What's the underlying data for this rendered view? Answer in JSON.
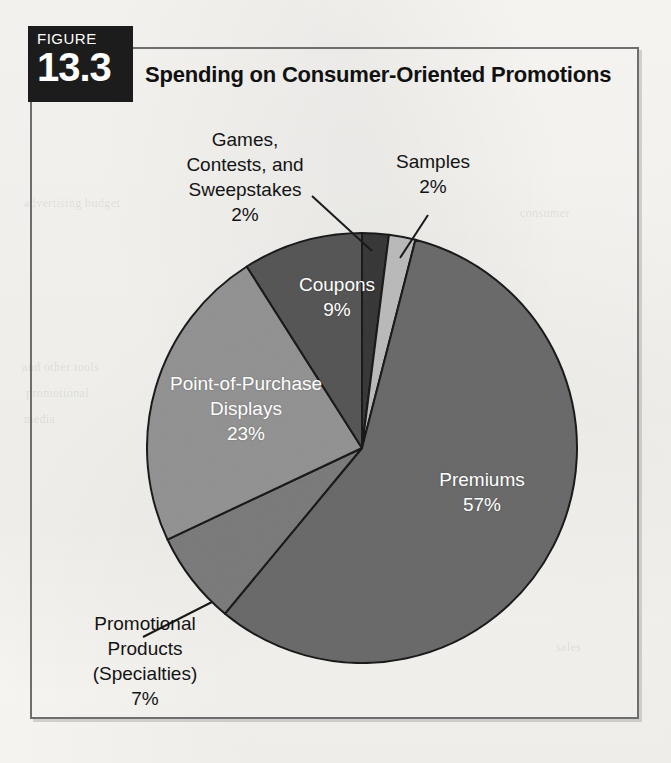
{
  "figure": {
    "badge_word": "FIGURE",
    "badge_number": "13.3",
    "title": "Spending on Consumer-Oriented Promotions"
  },
  "chart_data": {
    "type": "pie",
    "title": "Spending on Consumer-Oriented Promotions",
    "xlabel": "",
    "ylabel": "",
    "legend_position": "none",
    "grid": false,
    "total": 100,
    "units": "percent",
    "start_angle_deg": 0,
    "direction": "clockwise",
    "categories": [
      "Games, Contests, and Sweepstakes",
      "Samples",
      "Premiums",
      "Promotional Products (Specialties)",
      "Point-of-Purchase Displays",
      "Coupons"
    ],
    "values": [
      2,
      2,
      57,
      7,
      23,
      9
    ],
    "slices": [
      {
        "name": "Games, Contests, and Sweepstakes",
        "label_lines": [
          "Games,",
          "Contests, and",
          "Sweepstakes"
        ],
        "value": 2,
        "value_label": "2%",
        "color": "#3a3a3a",
        "label_placement": "callout",
        "start_deg": 0,
        "end_deg": 7.2
      },
      {
        "name": "Samples",
        "label_lines": [
          "Samples"
        ],
        "value": 2,
        "value_label": "2%",
        "color": "#bcbcbc",
        "label_placement": "callout",
        "start_deg": 7.2,
        "end_deg": 14.4
      },
      {
        "name": "Premiums",
        "label_lines": [
          "Premiums"
        ],
        "value": 57,
        "value_label": "57%",
        "color": "#6c6c6c",
        "label_placement": "inside",
        "start_deg": 14.4,
        "end_deg": 219.6
      },
      {
        "name": "Promotional Products (Specialties)",
        "label_lines": [
          "Promotional",
          "Products",
          "(Specialties)"
        ],
        "value": 7,
        "value_label": "7%",
        "color": "#7d7d7d",
        "label_placement": "callout",
        "start_deg": 219.6,
        "end_deg": 244.8
      },
      {
        "name": "Point-of-Purchase Displays",
        "label_lines": [
          "Point-of-Purchase",
          "Displays"
        ],
        "value": 23,
        "value_label": "23%",
        "color": "#949494",
        "label_placement": "inside",
        "start_deg": 244.8,
        "end_deg": 327.6
      },
      {
        "name": "Coupons",
        "label_lines": [
          "Coupons"
        ],
        "value": 9,
        "value_label": "9%",
        "color": "#585858",
        "label_placement": "inside",
        "start_deg": 327.6,
        "end_deg": 360
      }
    ]
  },
  "labels": {
    "games": {
      "line1": "Games,",
      "line2": "Contests, and",
      "line3": "Sweepstakes",
      "pct": "2%"
    },
    "samples": {
      "line1": "Samples",
      "pct": "2%"
    },
    "promotional": {
      "line1": "Promotional",
      "line2": "Products",
      "line3": "(Specialties)",
      "pct": "7%"
    },
    "coupons": {
      "line1": "Coupons",
      "pct": "9%"
    },
    "pop": {
      "line1": "Point-of-Purchase",
      "line2": "Displays",
      "pct": "23%"
    },
    "premiums": {
      "line1": "Premiums",
      "pct": "57%"
    }
  },
  "colors": {
    "badge_bg": "#1c1c1c",
    "frame_border": "#6e6e6e",
    "page_bg": "#faf9f6",
    "label_text": "#141414",
    "slice_label_text": "#ffffff",
    "pie_outline": "#1a1a1a"
  }
}
